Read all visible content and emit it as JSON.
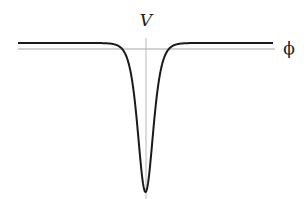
{
  "chart_data": {
    "type": "line",
    "title": "",
    "xlabel": "ϕ",
    "ylabel": "V",
    "grid": false,
    "legend": null,
    "functional_form": "V(ϕ) = V0 − A·sech²(kϕ)",
    "series": [
      {
        "name": "V(ϕ)",
        "x": [
          -4,
          -3,
          -2,
          -1.5,
          -1,
          -0.75,
          -0.5,
          -0.25,
          0,
          0.25,
          0.5,
          0.75,
          1,
          1.5,
          2,
          3,
          4
        ],
        "y": [
          0.04,
          0.03,
          -0.03,
          -0.12,
          -0.38,
          -0.58,
          -0.8,
          -0.96,
          -1.02,
          -0.96,
          -0.8,
          -0.58,
          -0.38,
          -0.12,
          -0.03,
          0.03,
          0.04
        ]
      }
    ],
    "plateau_value": 0.04,
    "minimum": {
      "x": 0,
      "y": -1.02
    },
    "xlim": [
      -4.6,
      4.6
    ],
    "ylim": [
      -1.05,
      0.15
    ]
  },
  "axes": {
    "x_label": "ϕ",
    "y_label": "V"
  },
  "colors": {
    "curve": "#1a1a1a",
    "axes": "#999999",
    "background": "#ffffff"
  }
}
